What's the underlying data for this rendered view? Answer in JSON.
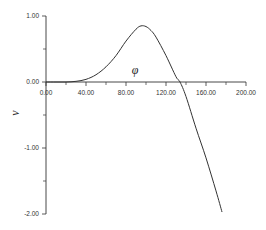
{
  "chart_data": {
    "type": "line",
    "title": "",
    "xlabel": "φ",
    "ylabel": "v",
    "xlim": [
      0,
      200
    ],
    "ylim": [
      -2,
      1
    ],
    "grid": false,
    "legend": null,
    "x_ticks": [
      "0.00",
      "40.00",
      "80.00",
      "120.00",
      "160.00",
      "200.00"
    ],
    "y_ticks": [
      "1.00",
      "0.00",
      "-1.00",
      "-2.00"
    ],
    "series": [
      {
        "name": "v(φ)",
        "color": "#333333",
        "x": [
          0,
          10,
          20,
          30,
          40,
          50,
          60,
          70,
          80,
          90,
          95,
          100,
          105,
          110,
          120,
          130,
          134,
          140,
          150,
          160,
          170,
          176
        ],
        "y": [
          0.0,
          0.0,
          0.0,
          0.01,
          0.04,
          0.11,
          0.23,
          0.4,
          0.62,
          0.8,
          0.85,
          0.84,
          0.78,
          0.68,
          0.4,
          0.08,
          0.0,
          -0.22,
          -0.7,
          -1.15,
          -1.65,
          -1.97
        ]
      }
    ]
  }
}
